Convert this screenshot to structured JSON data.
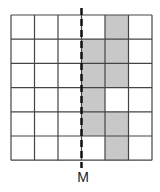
{
  "diagram": {
    "grid": {
      "columns": 6,
      "rows": 6,
      "left": 11,
      "top": 15,
      "cell_width": 23.5,
      "cell_height": 24.2,
      "line_color": "#444444",
      "fill_color": "#c8c8c8",
      "shaded_cells": [
        {
          "row": 0,
          "col": 4
        },
        {
          "row": 1,
          "col": 3
        },
        {
          "row": 1,
          "col": 4
        },
        {
          "row": 2,
          "col": 3
        },
        {
          "row": 2,
          "col": 4
        },
        {
          "row": 3,
          "col": 3
        },
        {
          "row": 4,
          "col": 3
        },
        {
          "row": 4,
          "col": 4
        },
        {
          "row": 5,
          "col": 4
        }
      ]
    },
    "axis_line": {
      "x": 81.5,
      "y_start": 8,
      "y_end": 168,
      "style": "dashed",
      "color": "#111111"
    },
    "axis_label": "M"
  }
}
